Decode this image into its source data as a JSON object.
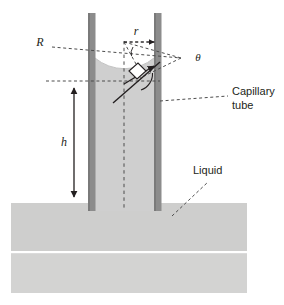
{
  "figure": {
    "background_color": "#ffffff",
    "labels": {
      "radius_of_curvature": "R",
      "tube_radius": "r",
      "contact_angle": "θ",
      "height": "h",
      "capillary_tube_line1": "Capillary",
      "capillary_tube_line2": "tube",
      "liquid": "Liquid"
    },
    "colors": {
      "tube_wall": "#8c8c8c",
      "tube_wall_edge": "#6f6f6f",
      "liquid_fill": "#cfcfcf",
      "liquid_pool": "#cececd",
      "liquid_pool_lower": "#d3d3d2",
      "line_stroke": "#231f20",
      "dashed_stroke": "#4d4d4d",
      "text": "#231f20",
      "white_gap": "#ffffff"
    },
    "geometry": {
      "tube_left_wall_x": 88,
      "tube_left_wall_width": 7,
      "tube_right_wall_x": 154,
      "tube_right_wall_width": 7,
      "tube_top_y": 13,
      "tube_bottom_y": 210,
      "pool_left_x": 11,
      "pool_right_x": 247,
      "pool_top_y": 203,
      "pool_bottom_y": 293,
      "pool_gap_y": 252,
      "meniscus_low_y": 81,
      "meniscus_contact_y": 58,
      "height_arrow_x": 74,
      "height_arrow_top_y": 84,
      "height_arrow_bottom_y": 201,
      "radius_arrow_y": 42,
      "radius_arrow_x1": 124,
      "radius_arrow_x2": 157,
      "center_x": 124,
      "apex_x": 181,
      "apex_y": 58
    }
  },
  "annotations": [
    {
      "name": "R",
      "x": 40,
      "y": 46,
      "text": "R"
    },
    {
      "name": "r",
      "x": 136,
      "y": 35,
      "text": "r"
    },
    {
      "name": "theta",
      "x": 197,
      "y": 61,
      "text": "θ"
    },
    {
      "name": "h",
      "x": 64,
      "y": 145,
      "text": "h"
    },
    {
      "name": "capillary-tube",
      "x": 232,
      "y": 95,
      "text": "Capillary"
    },
    {
      "name": "capillary-tube-2",
      "x": 232,
      "y": 109,
      "text": "tube"
    },
    {
      "name": "liquid",
      "x": 194,
      "y": 173,
      "text": "Liquid"
    }
  ]
}
